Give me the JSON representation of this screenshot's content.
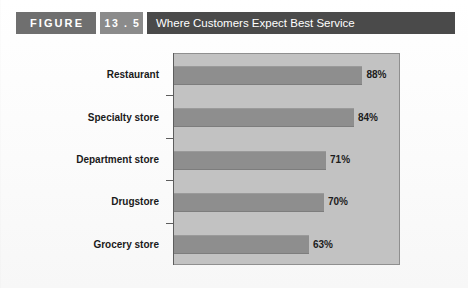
{
  "header": {
    "figure_label": "FIGURE",
    "figure_number": "13 . 5",
    "title": "Where Customers Expect Best Service",
    "colors": {
      "figure_block": "#6f6f6f",
      "number_badge": "#8b8b8b",
      "title_bar": "#4a4a4a"
    }
  },
  "chart_data": {
    "type": "bar",
    "orientation": "horizontal",
    "title": "Where Customers Expect Best Service",
    "xlabel": "",
    "ylabel": "",
    "xlim": [
      0,
      106
    ],
    "grid": false,
    "legend": null,
    "value_suffix": "%",
    "categories": [
      "Restaurant",
      "Specialty store",
      "Department store",
      "Drugstore",
      "Grocery store"
    ],
    "values": [
      88,
      84,
      71,
      70,
      63
    ],
    "value_labels": [
      "88%",
      "84%",
      "71%",
      "70%",
      "63%"
    ],
    "colors": {
      "bar": "#8e8e8e",
      "plot_background": "#c2c2c2",
      "axis": "#5d5d5d",
      "label_text": "#1a1a1a"
    }
  },
  "source_note": ""
}
